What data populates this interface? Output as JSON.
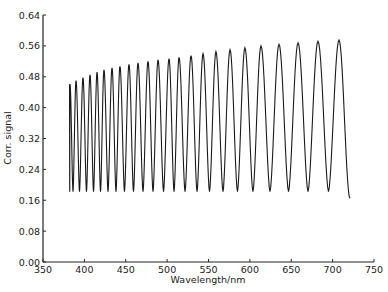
{
  "chart_data": {
    "type": "line",
    "title": "",
    "xlabel": "Wavelength/nm",
    "ylabel": "Corr. signal",
    "xlim": [
      350,
      750
    ],
    "ylim": [
      0.0,
      0.64
    ],
    "x_ticks": [
      350,
      400,
      450,
      500,
      550,
      600,
      650,
      700,
      750
    ],
    "x_tick_labels": [
      "350",
      "400",
      "450",
      "500",
      "550",
      "600",
      "650",
      "700",
      "750"
    ],
    "y_ticks": [
      0.0,
      0.08,
      0.16,
      0.24,
      0.32,
      0.4,
      0.48,
      0.56,
      0.64
    ],
    "y_tick_labels": [
      "0.00",
      "0.08",
      "0.16",
      "0.24",
      "0.32",
      "0.40",
      "0.48",
      "0.56",
      "0.64"
    ],
    "grid": false,
    "legend": null,
    "series": [
      {
        "name": "Corr. signal",
        "description": "Oscillating interference fringe signal; peaks rise from ~0.46 to ~0.575, troughs ~0.18",
        "start": {
          "x": 382,
          "y": 0.46
        },
        "end": {
          "x": 721,
          "y": 0.165
        },
        "peaks_x": [
          382.6,
          389.9,
          398.3,
          406.8,
          415.3,
          423.7,
          433.4,
          443.0,
          453.9,
          464.8,
          476.9,
          489.0,
          502.3,
          514.4,
          528.9,
          543.4,
          559.0,
          576.0,
          594.0,
          613.4,
          635.2,
          658.2,
          682.3,
          707.7
        ],
        "peaks_y": [
          0.461,
          0.47,
          0.478,
          0.485,
          0.492,
          0.498,
          0.503,
          0.507,
          0.512,
          0.516,
          0.52,
          0.524,
          0.527,
          0.53,
          0.535,
          0.54,
          0.545,
          0.55,
          0.555,
          0.56,
          0.564,
          0.568,
          0.572,
          0.575
        ],
        "trough_y": 0.182
      }
    ]
  }
}
